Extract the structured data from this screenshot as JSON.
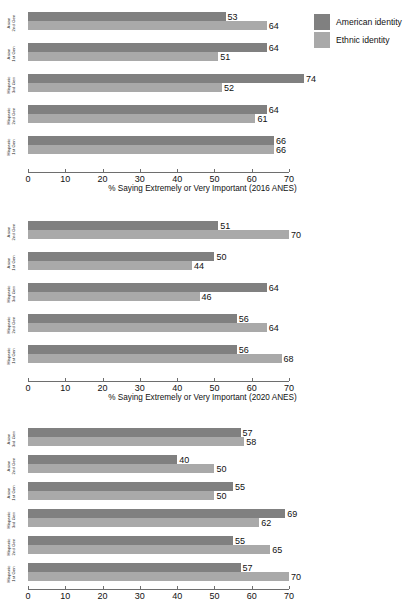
{
  "legend": {
    "items": [
      {
        "label": "American identity",
        "color": "#808080",
        "key": "american"
      },
      {
        "label": "Ethnic identity",
        "color": "#a9a9a9",
        "key": "ethnic"
      }
    ]
  },
  "axis": {
    "ticks": [
      "0",
      "10",
      "20",
      "30",
      "40",
      "50",
      "60",
      "70"
    ]
  },
  "chart_data": [
    {
      "type": "bar",
      "orientation": "horizontal",
      "title": "",
      "xlabel": "% Saying Extremely or Very Important (2016 ANES)",
      "ylabel": "",
      "xlim": [
        0,
        70
      ],
      "xticks": [
        0,
        10,
        20,
        30,
        40,
        50,
        60,
        70
      ],
      "grid": false,
      "legend_position": "top-right",
      "categories": [
        "Asian 2nd Gen",
        "Asian 1st Gen",
        "Hispanic 3rd Gen",
        "Hispanic 2nd Gen",
        "Hispanic 1st Gen"
      ],
      "category_lines": [
        [
          "Asian",
          "2nd Gen"
        ],
        [
          "Asian",
          "1st Gen"
        ],
        [
          "Hispanic",
          "3rd Gen"
        ],
        [
          "Hispanic",
          "2nd Gen"
        ],
        [
          "Hispanic",
          "1st Gen"
        ]
      ],
      "series": [
        {
          "name": "American identity",
          "color": "#808080",
          "values": [
            53,
            64,
            74,
            64,
            66
          ]
        },
        {
          "name": "Ethnic identity",
          "color": "#a9a9a9",
          "values": [
            64,
            51,
            52,
            61,
            66
          ]
        }
      ]
    },
    {
      "type": "bar",
      "orientation": "horizontal",
      "title": "",
      "xlabel": "% Saying Extremely or Very Important (2020 ANES)",
      "ylabel": "",
      "xlim": [
        0,
        70
      ],
      "xticks": [
        0,
        10,
        20,
        30,
        40,
        50,
        60,
        70
      ],
      "grid": false,
      "legend_position": "none",
      "categories": [
        "Asian 2nd Gen",
        "Asian 1st Gen",
        "Hispanic 3rd Gen",
        "Hispanic 2nd Gen",
        "Hispanic 1st Gen"
      ],
      "category_lines": [
        [
          "Asian",
          "2nd Gen"
        ],
        [
          "Asian",
          "1st Gen"
        ],
        [
          "Hispanic",
          "3rd Gen"
        ],
        [
          "Hispanic",
          "2nd Gen"
        ],
        [
          "Hispanic",
          "1st Gen"
        ]
      ],
      "series": [
        {
          "name": "American identity",
          "color": "#808080",
          "values": [
            51,
            50,
            64,
            56,
            56
          ]
        },
        {
          "name": "Ethnic identity",
          "color": "#a9a9a9",
          "values": [
            70,
            44,
            46,
            64,
            68
          ]
        }
      ]
    },
    {
      "type": "bar",
      "orientation": "horizontal",
      "title": "",
      "xlabel": "",
      "ylabel": "",
      "xlim": [
        0,
        70
      ],
      "xticks": [
        0,
        10,
        20,
        30,
        40,
        50,
        60,
        70
      ],
      "grid": false,
      "legend_position": "none",
      "categories": [
        "Asian 3rd Gen",
        "Asian 2nd Gen",
        "Asian 1st Gen",
        "Hispanic 3rd Gen",
        "Hispanic 2nd Gen",
        "Hispanic 1st Gen"
      ],
      "category_lines": [
        [
          "Asian",
          "3rd Gen"
        ],
        [
          "Asian",
          "2nd Gen"
        ],
        [
          "Asian",
          "1st Gen"
        ],
        [
          "Hispanic",
          "3rd Gen"
        ],
        [
          "Hispanic",
          "2nd Gen"
        ],
        [
          "Hispanic",
          "1st Gen"
        ]
      ],
      "series": [
        {
          "name": "American identity",
          "color": "#808080",
          "values": [
            57,
            40,
            55,
            69,
            55,
            57
          ]
        },
        {
          "name": "Ethnic identity",
          "color": "#a9a9a9",
          "values": [
            58,
            50,
            50,
            62,
            65,
            70
          ]
        }
      ]
    }
  ]
}
